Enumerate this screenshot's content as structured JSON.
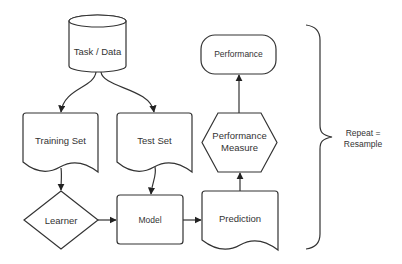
{
  "diagram": {
    "type": "flowchart",
    "nodes": {
      "task_data": {
        "label": "Task / Data",
        "shape": "cylinder"
      },
      "training_set": {
        "label": "Training Set",
        "shape": "document"
      },
      "test_set": {
        "label": "Test Set",
        "shape": "document"
      },
      "learner": {
        "label": "Learner",
        "shape": "diamond"
      },
      "model": {
        "label": "Model",
        "shape": "rounded-rectangle"
      },
      "prediction": {
        "label": "Prediction",
        "shape": "document"
      },
      "performance_measure": {
        "line1": "Performance",
        "line2": "Measure",
        "shape": "hexagon"
      },
      "performance": {
        "label": "Performance",
        "shape": "terminator"
      }
    },
    "edges": [
      {
        "from": "Task / Data",
        "to": "Training Set"
      },
      {
        "from": "Task / Data",
        "to": "Test Set"
      },
      {
        "from": "Training Set",
        "to": "Learner"
      },
      {
        "from": "Test Set",
        "to": "Model"
      },
      {
        "from": "Learner",
        "to": "Model"
      },
      {
        "from": "Model",
        "to": "Prediction"
      },
      {
        "from": "Prediction",
        "to": "Performance Measure"
      },
      {
        "from": "Performance Measure",
        "to": "Performance"
      }
    ],
    "brace": {
      "line1": "Repeat =",
      "line2": "Resample"
    },
    "colors": {
      "stroke": "#333333",
      "fill": "#ffffff",
      "text": "#333333"
    }
  }
}
